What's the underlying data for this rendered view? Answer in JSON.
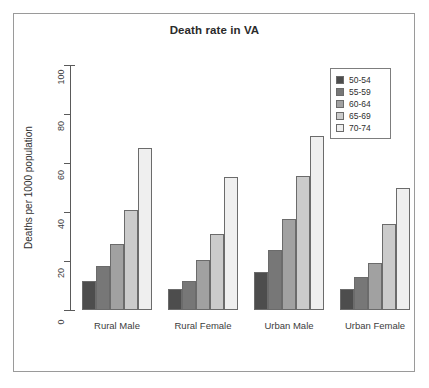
{
  "chart_data": {
    "type": "bar",
    "title": "Death rate in VA",
    "xlabel": "",
    "ylabel": "Deaths per 1000 population",
    "ylim": [
      0,
      100
    ],
    "yticks": [
      0,
      20,
      40,
      60,
      80,
      100
    ],
    "grid": false,
    "grouped": true,
    "legend_position": "top-right",
    "categories": [
      "Rural Male",
      "Rural Female",
      "Urban Male",
      "Urban Female"
    ],
    "series": [
      {
        "name": "50-54",
        "color": "#4d4d4d",
        "values": [
          11.7,
          8.7,
          15.4,
          8.4
        ]
      },
      {
        "name": "55-59",
        "color": "#777777",
        "values": [
          18.1,
          11.7,
          24.3,
          13.6
        ]
      },
      {
        "name": "60-64",
        "color": "#a1a1a1",
        "values": [
          26.9,
          20.3,
          37.0,
          19.3
        ]
      },
      {
        "name": "65-69",
        "color": "#cbcbcb",
        "values": [
          41.0,
          30.9,
          54.6,
          35.1
        ]
      },
      {
        "name": "70-74",
        "color": "#efefef",
        "values": [
          66.0,
          54.3,
          71.1,
          50.0
        ]
      }
    ]
  },
  "legend": {
    "entries": [
      {
        "label": "50-54",
        "color": "#4d4d4d"
      },
      {
        "label": "55-59",
        "color": "#777777"
      },
      {
        "label": "60-64",
        "color": "#a1a1a1"
      },
      {
        "label": "65-69",
        "color": "#cbcbcb"
      },
      {
        "label": "70-74",
        "color": "#efefef"
      }
    ]
  },
  "axes": {
    "y_title": "Deaths per 1000 population",
    "y_tick_labels": [
      "0",
      "20",
      "40",
      "60",
      "80",
      "100"
    ],
    "x_tick_labels": [
      "Rural Male",
      "Rural Female",
      "Urban Male",
      "Urban Female"
    ]
  },
  "colors": {
    "frame": "#9a9a9a",
    "axis": "#5a5a5a",
    "bar_outline": "#6b6b6b",
    "text": "#2f2f2f",
    "background": "#ffffff"
  }
}
